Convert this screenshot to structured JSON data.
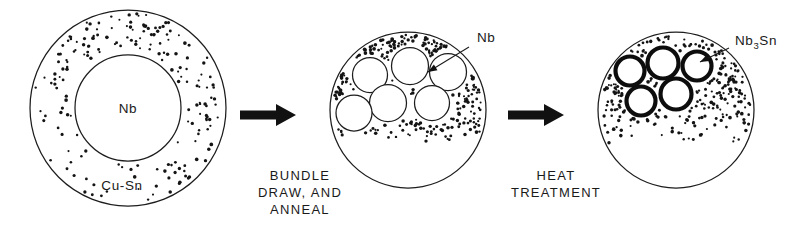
{
  "figure": {
    "background_color": "#ffffff",
    "ink_color": "#1a1a1a",
    "width": 803,
    "height": 237
  },
  "panels": [
    {
      "id": "panel-1",
      "name": "monofilament-billet",
      "center": {
        "x": 128,
        "y": 108
      },
      "outer_radius": 98,
      "inner_radius": 53,
      "labels": {
        "core": "Nb",
        "matrix": "Cu-Sn"
      },
      "core_label_pos": {
        "x": 128,
        "y": 113
      },
      "matrix_label_pos": {
        "x": 122,
        "y": 190
      },
      "filament_count": 0,
      "filaments": [],
      "stipple_region": "annulus",
      "stipple_count": 190
    },
    {
      "id": "panel-2",
      "name": "multifilament-after-bundle-draw",
      "center": {
        "x": 408,
        "y": 110
      },
      "outer_radius": 78,
      "inner_radius": 0,
      "labels": {
        "callout": "Nb"
      },
      "callout_pos": {
        "x": 477,
        "y": 42
      },
      "callout_leader": {
        "x1": 469,
        "y1": 47,
        "x2": 428,
        "y2": 72
      },
      "filament_count": 6,
      "filaments": [
        {
          "cx": 370,
          "cy": 75,
          "r": 17.5
        },
        {
          "cx": 410,
          "cy": 66,
          "r": 18.5
        },
        {
          "cx": 448,
          "cy": 72,
          "r": 18.5
        },
        {
          "cx": 388,
          "cy": 103,
          "r": 18.5
        },
        {
          "cx": 432,
          "cy": 103,
          "r": 17.5
        },
        {
          "cx": 354,
          "cy": 113,
          "r": 18.0
        }
      ],
      "stipple_region": "upper-disc",
      "stipple_count": 230
    },
    {
      "id": "panel-3",
      "name": "reacted-filaments-after-heat-treatment",
      "center": {
        "x": 676,
        "y": 110
      },
      "outer_radius": 78,
      "inner_radius": 0,
      "labels": {
        "callout": "Nb",
        "callout_sub": "3",
        "callout_tail": "Sn"
      },
      "callout_pos": {
        "x": 735,
        "y": 45
      },
      "callout_leader": {
        "x1": 729,
        "y1": 48,
        "x2": 700,
        "y2": 62
      },
      "filament_count": 5,
      "filaments": [
        {
          "cx": 630,
          "cy": 71,
          "r": 14.5
        },
        {
          "cx": 663,
          "cy": 63,
          "r": 15.5
        },
        {
          "cx": 697,
          "cy": 66,
          "r": 14.5
        },
        {
          "cx": 641,
          "cy": 101,
          "r": 14.5
        },
        {
          "cx": 676,
          "cy": 94,
          "r": 15.5
        }
      ],
      "stipple_region": "upper-disc",
      "stipple_count": 250
    }
  ],
  "arrows": [
    {
      "id": "arrow-1",
      "name": "arrow-bundle-draw-anneal",
      "x": 240,
      "y": 115,
      "length": 56,
      "shaft_height": 9,
      "head_width": 20,
      "head_height": 22,
      "color": "#111111"
    },
    {
      "id": "arrow-2",
      "name": "arrow-heat-treatment",
      "x": 508,
      "y": 115,
      "length": 56,
      "shaft_height": 9,
      "head_width": 20,
      "head_height": 22,
      "color": "#111111"
    }
  ],
  "process_steps": [
    {
      "id": "step-1",
      "name": "bundle-draw-anneal",
      "anchor_x": 300,
      "anchor_y": 180,
      "line_height": 17,
      "lines": [
        "BUNDLE",
        "DRAW, AND",
        "ANNEAL"
      ]
    },
    {
      "id": "step-2",
      "name": "heat-treatment",
      "anchor_x": 556,
      "anchor_y": 180,
      "line_height": 17,
      "lines": [
        "HEAT",
        "TREATMENT"
      ]
    }
  ]
}
